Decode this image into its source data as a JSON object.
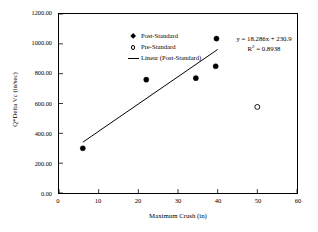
{
  "chart_data": {
    "type": "scatter",
    "title": "",
    "xlabel": "Maximum Crush (in)",
    "ylabel": "Q*Delta Vc (in/sec)",
    "xlim": [
      0,
      60
    ],
    "ylim": [
      0,
      1200
    ],
    "xticks": [
      0,
      10,
      20,
      30,
      40,
      50,
      60
    ],
    "xtick_labels": [
      "0",
      "10",
      "20",
      "30",
      "40",
      "50",
      "60"
    ],
    "yticks": [
      0,
      200,
      400,
      600,
      800,
      1000,
      1200
    ],
    "ytick_labels": [
      "0.00",
      "200.00",
      "400.00",
      "600.00",
      "800.00",
      "1000.00",
      "1200.00"
    ],
    "grid": false,
    "legend_position": "top-left",
    "series": [
      {
        "name": "Post-Standard",
        "marker": "filled-diamond",
        "color": "#000000",
        "points": [
          {
            "x": 6.0,
            "y": 300
          },
          {
            "x": 22.0,
            "y": 760
          },
          {
            "x": 34.5,
            "y": 770
          },
          {
            "x": 39.7,
            "y": 1035
          },
          {
            "x": 39.5,
            "y": 850
          }
        ]
      },
      {
        "name": "Pre-Standard",
        "marker": "open-circle",
        "color": "#000000",
        "points": [
          {
            "x": 50.0,
            "y": 577
          }
        ]
      },
      {
        "name": "Linear (Post-Standard)",
        "marker": "line",
        "color": "#000000",
        "fit": {
          "slope": 18.286,
          "intercept": 230.9,
          "r_squared": 0.8938,
          "x_start": 6.0,
          "x_end": 40.0
        }
      }
    ],
    "annotations": [
      {
        "text": "y = 18.286x + 230.9",
        "x": 44.0,
        "y": 1060
      },
      {
        "text": "R² = 0.8938",
        "x": 46.0,
        "y": 990
      }
    ]
  },
  "legend": {
    "items": [
      {
        "label": "Post-Standard",
        "key": "filled-diamond-icon"
      },
      {
        "label": "Pre-Standard",
        "key": "open-circle-icon"
      },
      {
        "label": "Linear (Post-Standard)",
        "key": "line-segment-icon"
      }
    ]
  },
  "annotation": {
    "equation_prefix": "y = ",
    "equation": "y = 18.286x + 230.9",
    "r_squared_label": "R",
    "r_squared_sup": "2",
    "r_squared_value": " = 0.8938"
  },
  "axes": {
    "x_title": "Maximum Crush (in)",
    "y_title": "Q*Delta Vc (in/sec)",
    "x_labels": [
      "0",
      "10",
      "20",
      "30",
      "40",
      "50",
      "60"
    ],
    "y_labels": [
      "0.00",
      "200.00",
      "400.00",
      "600.00",
      "800.00",
      "1000.00",
      "1200.00"
    ]
  }
}
